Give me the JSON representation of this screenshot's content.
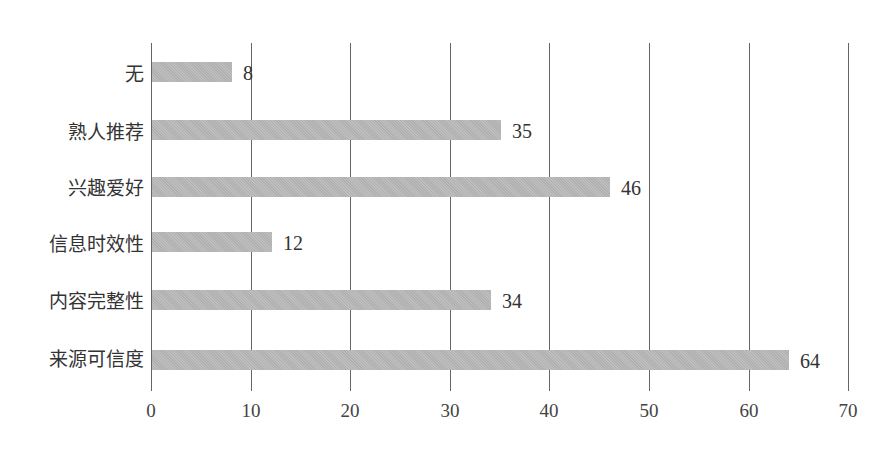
{
  "chart_data": {
    "type": "bar",
    "orientation": "horizontal",
    "title": "",
    "xlabel": "",
    "ylabel": "",
    "categories": [
      "无",
      "熟人推荐",
      "兴趣爱好",
      "信息时效性",
      "内容完整性",
      "来源可信度"
    ],
    "values": [
      8,
      35,
      46,
      12,
      34,
      64
    ],
    "data_labels": [
      "8",
      "35",
      "46",
      "12",
      "34",
      "64"
    ],
    "xlim": [
      0,
      70
    ],
    "x_ticks": [
      "0",
      "10",
      "20",
      "30",
      "40",
      "50",
      "60",
      "70"
    ],
    "grid": "vertical lines at each major tick",
    "legend": "none",
    "bar_color": "#b9b9b9"
  }
}
